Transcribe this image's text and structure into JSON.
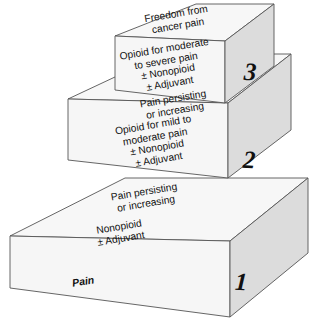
{
  "figure": {
    "name": "who-analgesic-ladder",
    "colors": {
      "top_face": "#f7f7f7",
      "front_face": "#f6f6f6",
      "side_face": "#dcdcdc",
      "outline": "#555555",
      "text": "#111111",
      "background": "#ffffff"
    }
  },
  "steps": [
    {
      "number": "1",
      "top_text": "Pain persisting\nor increasing",
      "front_text": "Nonopioid\n± Adjuvant"
    },
    {
      "number": "2",
      "top_text": "Pain persisting\nor increasing",
      "front_text": "Opioid for mild to\nmoderate pain\n± Nonopioid\n± Adjuvant"
    },
    {
      "number": "3",
      "top_text": "Freedom from\ncancer pain",
      "front_text": "Opioid for moderate\nto severe pain\n± Nonopioid\n± Adjuvant"
    }
  ],
  "base_label": "Pain"
}
